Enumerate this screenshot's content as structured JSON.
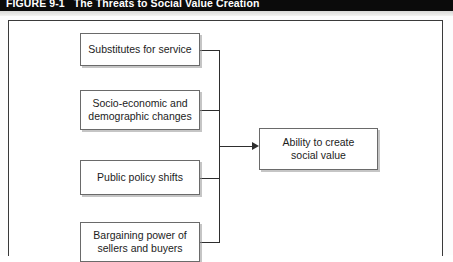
{
  "figure": {
    "number_label": "FIGURE 9-1",
    "title": "The Threats to Social Value Creation"
  },
  "diagram": {
    "type": "flow-diagram",
    "direction": "left-to-right",
    "threat_nodes": [
      {
        "id": "substitutes",
        "label": "Substitutes for service"
      },
      {
        "id": "socio",
        "label": "Socio-economic and\ndemographic changes"
      },
      {
        "id": "policy",
        "label": "Public policy shifts"
      },
      {
        "id": "bargaining",
        "label": "Bargaining power of\nsellers and buyers"
      }
    ],
    "outcome_node": {
      "id": "outcome",
      "label": "Ability to create\nsocial value"
    },
    "connector_note": "All four threat boxes join a shared vertical bus that feeds a single arrow into the outcome box."
  },
  "colors": {
    "title_bar_background": "#0b0b0b",
    "title_bar_text": "#ffffff",
    "box_border": "#6a6a6a",
    "box_fill": "#ffffff",
    "connector": "#2e2e2e",
    "frame_border": "#3a3a3a",
    "page_background": "#ffffff"
  }
}
